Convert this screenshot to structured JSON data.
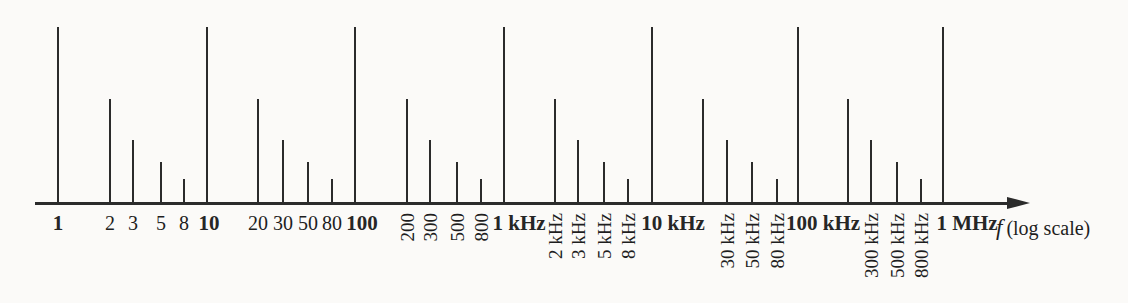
{
  "figure": {
    "axis_symbol": "f",
    "axis_note": "(log scale)"
  },
  "colors": {
    "background": "#fbfaf8",
    "line": "#2b2b2b",
    "text": "#1e1e1e"
  },
  "chart_data": {
    "type": "bar",
    "title": "",
    "xlabel": "f (log scale)",
    "ylabel": "",
    "x_scale": "log",
    "x_range_hz": [
      1,
      1000000
    ],
    "grid": false,
    "legend": "none",
    "tier_heights": {
      "1": 176,
      "2": 104,
      "3": 63,
      "5": 41,
      "8": 24
    },
    "axis": {
      "baseline_y": 203,
      "x_start": 35,
      "x_line_end": 1008,
      "arrow_tip_x": 1030,
      "label_x": 996,
      "label_y": 215
    },
    "ticks": [
      {
        "freq_hz": 1,
        "label": "1",
        "x": 58,
        "tier": "1",
        "label_style": "bold-horizontal",
        "dx": 0
      },
      {
        "freq_hz": 2,
        "label": "2",
        "x": 110,
        "tier": "2",
        "label_style": "horizontal",
        "dx": 0
      },
      {
        "freq_hz": 3,
        "label": "3",
        "x": 133,
        "tier": "3",
        "label_style": "horizontal",
        "dx": 0
      },
      {
        "freq_hz": 5,
        "label": "5",
        "x": 161,
        "tier": "5",
        "label_style": "horizontal",
        "dx": 0
      },
      {
        "freq_hz": 8,
        "label": "8",
        "x": 184,
        "tier": "8",
        "label_style": "horizontal",
        "dx": 0
      },
      {
        "freq_hz": 10,
        "label": "10",
        "x": 207,
        "tier": "1",
        "label_style": "bold-horizontal",
        "dx": 2
      },
      {
        "freq_hz": 20,
        "label": "20",
        "x": 258,
        "tier": "2",
        "label_style": "horizontal",
        "dx": 0
      },
      {
        "freq_hz": 30,
        "label": "30",
        "x": 283,
        "tier": "3",
        "label_style": "horizontal",
        "dx": 0
      },
      {
        "freq_hz": 50,
        "label": "50",
        "x": 308,
        "tier": "5",
        "label_style": "horizontal",
        "dx": 0
      },
      {
        "freq_hz": 80,
        "label": "80",
        "x": 332,
        "tier": "8",
        "label_style": "horizontal",
        "dx": 0
      },
      {
        "freq_hz": 100,
        "label": "100",
        "x": 355,
        "tier": "1",
        "label_style": "bold-horizontal",
        "dx": 7
      },
      {
        "freq_hz": 200,
        "label": "200",
        "x": 407,
        "tier": "2",
        "label_style": "vertical",
        "dx": 0
      },
      {
        "freq_hz": 300,
        "label": "300",
        "x": 430,
        "tier": "3",
        "label_style": "vertical",
        "dx": 0
      },
      {
        "freq_hz": 500,
        "label": "500",
        "x": 457,
        "tier": "5",
        "label_style": "vertical",
        "dx": 0
      },
      {
        "freq_hz": 800,
        "label": "800",
        "x": 481,
        "tier": "8",
        "label_style": "vertical",
        "dx": 0
      },
      {
        "freq_hz": 1000,
        "label": "1 kHz",
        "x": 504,
        "tier": "1",
        "label_style": "bold-horizontal",
        "dx": 15
      },
      {
        "freq_hz": 2000,
        "label": "2 kHz",
        "x": 555,
        "tier": "2",
        "label_style": "vertical",
        "dx": 0
      },
      {
        "freq_hz": 3000,
        "label": "3 kHz",
        "x": 578,
        "tier": "3",
        "label_style": "vertical",
        "dx": 0
      },
      {
        "freq_hz": 5000,
        "label": "5 kHz",
        "x": 604,
        "tier": "5",
        "label_style": "vertical",
        "dx": 0
      },
      {
        "freq_hz": 8000,
        "label": "8 kHz",
        "x": 628,
        "tier": "8",
        "label_style": "vertical",
        "dx": 0
      },
      {
        "freq_hz": 10000,
        "label": "10 kHz",
        "x": 652,
        "tier": "1",
        "label_style": "bold-horizontal",
        "dx": 21
      },
      {
        "freq_hz": 20000,
        "label": "",
        "x": 703,
        "tier": "2",
        "label_style": "none",
        "dx": 0
      },
      {
        "freq_hz": 30000,
        "label": "30 kHz",
        "x": 727,
        "tier": "3",
        "label_style": "vertical",
        "dx": 0
      },
      {
        "freq_hz": 50000,
        "label": "50 kHz",
        "x": 752,
        "tier": "5",
        "label_style": "vertical",
        "dx": 0
      },
      {
        "freq_hz": 80000,
        "label": "80 kHz",
        "x": 777,
        "tier": "8",
        "label_style": "vertical",
        "dx": 0
      },
      {
        "freq_hz": 100000,
        "label": "100 kHz",
        "x": 798,
        "tier": "1",
        "label_style": "bold-horizontal",
        "dx": 25
      },
      {
        "freq_hz": 200000,
        "label": "",
        "x": 848,
        "tier": "2",
        "label_style": "none",
        "dx": 0
      },
      {
        "freq_hz": 300000,
        "label": "300 kHz",
        "x": 871,
        "tier": "3",
        "label_style": "vertical",
        "dx": 0
      },
      {
        "freq_hz": 500000,
        "label": "500 kHz",
        "x": 897,
        "tier": "5",
        "label_style": "vertical",
        "dx": 0
      },
      {
        "freq_hz": 800000,
        "label": "800 kHz",
        "x": 921,
        "tier": "8",
        "label_style": "vertical",
        "dx": 0
      },
      {
        "freq_hz": 1000000,
        "label": "1 MHz",
        "x": 943,
        "tier": "1",
        "label_style": "bold-horizontal",
        "dx": 24
      }
    ]
  }
}
